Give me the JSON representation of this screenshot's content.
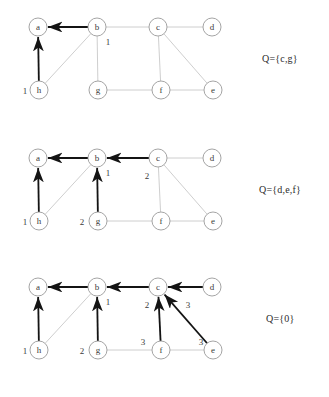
{
  "figure": {
    "node_radius": 9,
    "colors": {
      "base_edge": "#c8c8c8",
      "tree_edge": "#141414",
      "node_stroke": "#9a9a9a",
      "node_fill": "#ffffff",
      "text": "#333333"
    },
    "nodes": {
      "a": {
        "x": 38,
        "y": 27,
        "label": "a"
      },
      "b": {
        "x": 97,
        "y": 27,
        "label": "b"
      },
      "c": {
        "x": 158,
        "y": 27,
        "label": "c"
      },
      "d": {
        "x": 212,
        "y": 27,
        "label": "d"
      },
      "h": {
        "x": 39,
        "y": 90,
        "label": "h"
      },
      "g": {
        "x": 98,
        "y": 90,
        "label": "g"
      },
      "f": {
        "x": 161,
        "y": 90,
        "label": "f"
      },
      "e": {
        "x": 213,
        "y": 90,
        "label": "e"
      }
    },
    "base_edges": [
      [
        "a",
        "b"
      ],
      [
        "b",
        "c"
      ],
      [
        "c",
        "d"
      ],
      [
        "b",
        "g"
      ],
      [
        "c",
        "f"
      ],
      [
        "c",
        "e"
      ],
      [
        "g",
        "f"
      ],
      [
        "f",
        "e"
      ],
      [
        "h",
        "b"
      ]
    ]
  },
  "panels": [
    {
      "name": "panel-1",
      "q_label": "Q={c,g}",
      "q_x": 262,
      "q_y": 53,
      "tree_edges": [
        {
          "from": "b",
          "to": "a"
        },
        {
          "from": "h",
          "to": "a"
        }
      ],
      "edge_labels": [
        {
          "text": "1",
          "x": 108,
          "y": 45
        },
        {
          "text": "1",
          "x": 25,
          "y": 94
        }
      ]
    },
    {
      "name": "panel-2",
      "q_label": "Q={d,e,f}",
      "q_x": 259,
      "q_y": 53,
      "tree_edges": [
        {
          "from": "b",
          "to": "a"
        },
        {
          "from": "c",
          "to": "b"
        },
        {
          "from": "h",
          "to": "a"
        },
        {
          "from": "g",
          "to": "b"
        }
      ],
      "edge_labels": [
        {
          "text": "1",
          "x": 108,
          "y": 45
        },
        {
          "text": "2",
          "x": 147,
          "y": 48
        },
        {
          "text": "1",
          "x": 25,
          "y": 94
        },
        {
          "text": "2",
          "x": 82,
          "y": 94
        }
      ]
    },
    {
      "name": "panel-3",
      "q_label": "Q={0}",
      "q_x": 266,
      "q_y": 53,
      "tree_edges": [
        {
          "from": "b",
          "to": "a"
        },
        {
          "from": "c",
          "to": "b"
        },
        {
          "from": "d",
          "to": "c"
        },
        {
          "from": "h",
          "to": "a"
        },
        {
          "from": "g",
          "to": "b"
        },
        {
          "from": "f",
          "to": "c"
        },
        {
          "from": "e",
          "to": "c"
        }
      ],
      "edge_labels": [
        {
          "text": "1",
          "x": 108,
          "y": 45
        },
        {
          "text": "2",
          "x": 147,
          "y": 48
        },
        {
          "text": "3",
          "x": 188,
          "y": 48
        },
        {
          "text": "1",
          "x": 25,
          "y": 94
        },
        {
          "text": "2",
          "x": 82,
          "y": 94
        },
        {
          "text": "3",
          "x": 143,
          "y": 85
        },
        {
          "text": "3",
          "x": 201,
          "y": 85
        }
      ]
    }
  ],
  "panel_tops": [
    0,
    131,
    260
  ]
}
